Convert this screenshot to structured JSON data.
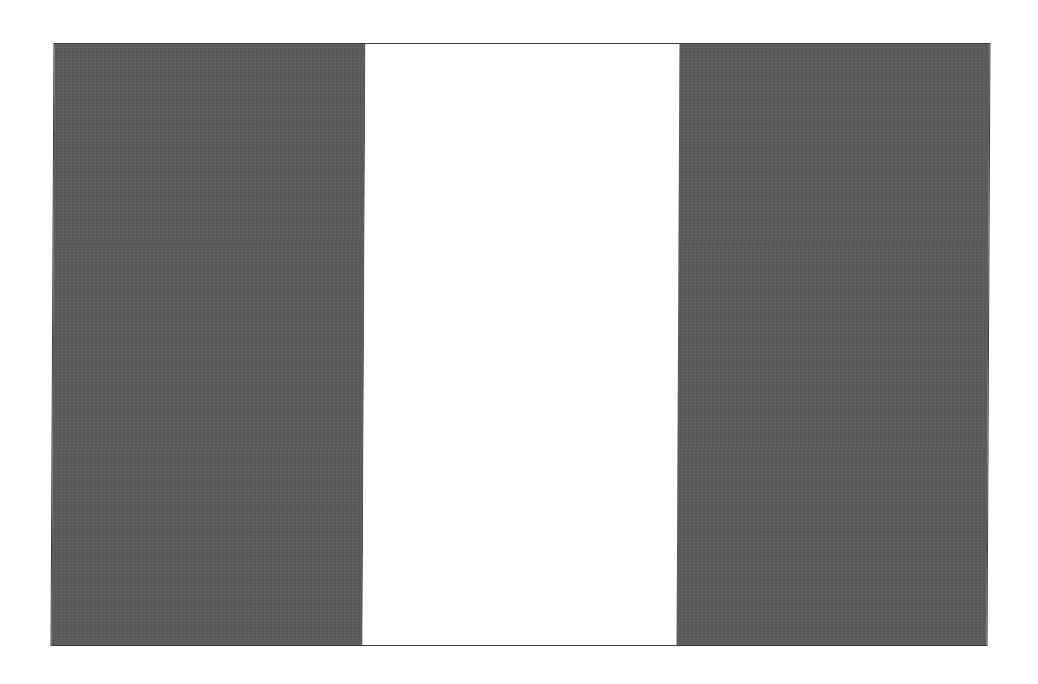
{
  "image": {
    "subject": "vertical tricolor flag",
    "bands": [
      {
        "name": "left-band",
        "color": "#5b5b5b",
        "width": 311
      },
      {
        "name": "center-band",
        "color": "#ffffff",
        "width": 314
      },
      {
        "name": "right-band",
        "color": "#5b5b5b",
        "width": 312
      }
    ],
    "border_color": "#3a3a3a",
    "background": "#ffffff"
  }
}
